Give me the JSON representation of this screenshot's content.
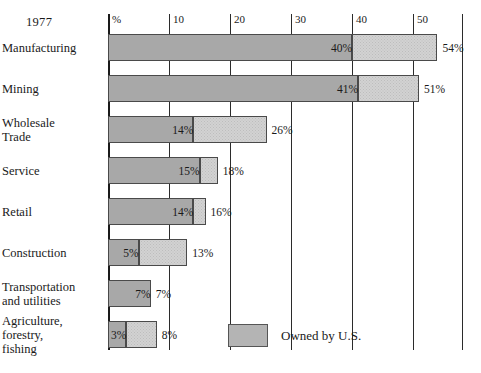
{
  "year_caption": "1977",
  "legend": {
    "swatch_name": "owned-by-us-swatch",
    "label": "Owned by U.S."
  },
  "chart_data": {
    "type": "bar",
    "orientation": "horizontal",
    "title": "1977",
    "xlabel": "%",
    "ylabel": "",
    "xlim": [
      0,
      58
    ],
    "grid": true,
    "legend_position": "bottom-right",
    "axis_first_tick_label": "%",
    "tick_values": [
      0,
      10,
      20,
      30,
      40,
      50
    ],
    "tick_labels": [
      "%",
      "10",
      "20",
      "30",
      "40",
      "50"
    ],
    "right_rule_value": 58,
    "categories": [
      "Manufacturing",
      "Mining",
      "Wholesale\nTrade",
      "Service",
      "Retail",
      "Construction",
      "Transportation\nand utilities",
      "Agriculture,\nforestry,\nfishing"
    ],
    "series": [
      {
        "name": "Owned by U.S.",
        "values": [
          40,
          41,
          14,
          15,
          14,
          5,
          7,
          3
        ]
      },
      {
        "name": "Total",
        "values": [
          54,
          51,
          26,
          18,
          16,
          13,
          7,
          8
        ]
      }
    ],
    "rows": [
      {
        "label": "Manufacturing",
        "owned": 40,
        "owned_label": "40%",
        "total": 54,
        "total_label": "54%"
      },
      {
        "label": "Mining",
        "owned": 41,
        "owned_label": "41%",
        "total": 51,
        "total_label": "51%"
      },
      {
        "label": "Wholesale\nTrade",
        "owned": 14,
        "owned_label": "14%",
        "total": 26,
        "total_label": "26%"
      },
      {
        "label": "Service",
        "owned": 15,
        "owned_label": "15%",
        "total": 18,
        "total_label": "18%"
      },
      {
        "label": "Retail",
        "owned": 14,
        "owned_label": "14%",
        "total": 16,
        "total_label": "16%"
      },
      {
        "label": "Construction",
        "owned": 5,
        "owned_label": "5%",
        "total": 13,
        "total_label": "13%"
      },
      {
        "label": "Transportation\nand utilities",
        "owned": 7,
        "owned_label": "7%",
        "total": 7,
        "total_label": "7%"
      },
      {
        "label": "Agriculture,\nforestry,\nfishing",
        "owned": 3,
        "owned_label": "3%",
        "total": 8,
        "total_label": "8%"
      }
    ],
    "colors": {
      "owned_fill": "#a8a8a8",
      "remainder_fill": "#d2d2d2",
      "outline": "#4a4a4a",
      "gridline": "#2b2b2b",
      "text": "#1a1a1a",
      "background": "#ffffff"
    }
  }
}
